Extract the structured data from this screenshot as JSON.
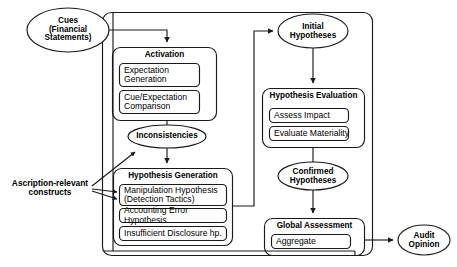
{
  "diagram": {
    "stroke_color": "#1a1a1a",
    "fill_color": "#ffffff",
    "text_color": "#000000",
    "nodes": {
      "cues": {
        "label": "Cues\n(Financial\nStatements)",
        "shape": "ellipse"
      },
      "initial_hypotheses": {
        "label": "Initial\nHypotheses",
        "shape": "ellipse"
      },
      "inconsistencies": {
        "label": "Inconsistencies",
        "shape": "ellipse"
      },
      "confirmed_hypotheses": {
        "label": "Confirmed\nHypotheses",
        "shape": "ellipse"
      },
      "audit_opinion": {
        "label": "Audit\nOpinion",
        "shape": "ellipse"
      },
      "ascription_constructs": {
        "label": "Ascription-relevant\nconstructs",
        "shape": "text"
      },
      "activation": {
        "title": "Activation",
        "items": [
          "Expectation\nGeneration",
          "Cue/Expectation\nComparison"
        ]
      },
      "hypothesis_generation": {
        "title": "Hypothesis Generation",
        "items": [
          "Manipulation Hypothesis\n(Detection Tactics)",
          "Accounting Error Hypothesis",
          "Insufficient Disclosure hp."
        ]
      },
      "hypothesis_evaluation": {
        "title": "Hypothesis Evaluation",
        "items": [
          "Assess Impact",
          "Evaluate Materiality"
        ]
      },
      "global_assessment": {
        "title": "Global Assessment",
        "items": [
          "Aggregate"
        ]
      }
    }
  }
}
